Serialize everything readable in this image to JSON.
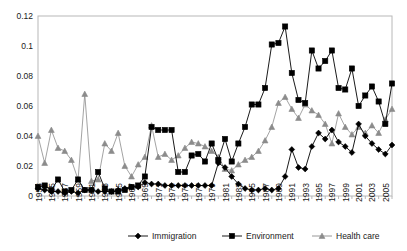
{
  "chart_data": {
    "type": "line",
    "title": "",
    "xlabel": "",
    "ylabel": "",
    "ylim": [
      0,
      0.12
    ],
    "yticks": [
      0,
      0.02,
      0.04,
      0.06,
      0.08,
      0.1,
      0.12
    ],
    "ytick_labels": [
      "0",
      "0.02",
      "0.04",
      "0.06",
      "0.08",
      "0.1",
      "0.12"
    ],
    "grid": false,
    "legend_position": "bottom",
    "x": [
      1953,
      1954,
      1955,
      1956,
      1957,
      1958,
      1959,
      1960,
      1961,
      1962,
      1963,
      1964,
      1965,
      1966,
      1967,
      1968,
      1969,
      1970,
      1971,
      1972,
      1973,
      1974,
      1975,
      1976,
      1977,
      1978,
      1979,
      1980,
      1981,
      1982,
      1983,
      1984,
      1985,
      1986,
      1987,
      1988,
      1989,
      1990,
      1991,
      1992,
      1993,
      1994,
      1995,
      1996,
      1997,
      1998,
      1999,
      2000,
      2001,
      2002,
      2003,
      2004,
      2005,
      2006
    ],
    "xtick_labels": [
      "1953",
      "1955",
      "1957",
      "1959",
      "1961",
      "1963",
      "1965",
      "1967",
      "1969",
      "1971",
      "1973",
      "1975",
      "1977",
      "1979",
      "1981",
      "1983",
      "1985",
      "1987",
      "1989",
      "1991",
      "1993",
      "1995",
      "1997",
      "1999",
      "2001",
      "2003",
      "2005"
    ],
    "series": [
      {
        "name": "Immigration",
        "marker": "diamond",
        "color": "#000000",
        "values": [
          0.005,
          0.004,
          0.003,
          0.003,
          0.002,
          0.003,
          0.002,
          0.004,
          0.004,
          0.003,
          0.003,
          0.003,
          0.004,
          0.005,
          0.006,
          0.006,
          0.009,
          0.008,
          0.008,
          0.007,
          0.007,
          0.007,
          0.007,
          0.007,
          0.007,
          0.007,
          0.007,
          0.022,
          0.019,
          0.013,
          0.008,
          0.005,
          0.004,
          0.004,
          0.005,
          0.004,
          0.005,
          0.013,
          0.031,
          0.019,
          0.018,
          0.033,
          0.042,
          0.038,
          0.044,
          0.036,
          0.033,
          0.029,
          0.048,
          0.04,
          0.035,
          0.031,
          0.028,
          0.034
        ]
      },
      {
        "name": "Environment",
        "marker": "square",
        "color": "#000000",
        "values": [
          0.006,
          0.007,
          0.004,
          0.011,
          0.003,
          0.004,
          0.011,
          0.004,
          0.004,
          0.016,
          0.005,
          0.003,
          0.003,
          0.004,
          0.006,
          0.007,
          0.013,
          0.046,
          0.044,
          0.044,
          0.044,
          0.016,
          0.016,
          0.027,
          0.028,
          0.023,
          0.035,
          0.024,
          0.038,
          0.023,
          0.035,
          0.046,
          0.061,
          0.061,
          0.072,
          0.101,
          0.102,
          0.113,
          0.082,
          0.064,
          0.062,
          0.097,
          0.085,
          0.09,
          0.097,
          0.072,
          0.071,
          0.085,
          0.06,
          0.067,
          0.073,
          0.063,
          0.048,
          0.075
        ]
      },
      {
        "name": "Health care",
        "marker": "triangle",
        "color": "#8c8c8c",
        "values": [
          0.04,
          0.022,
          0.044,
          0.032,
          0.03,
          0.024,
          0.011,
          0.068,
          0.01,
          0.011,
          0.035,
          0.03,
          0.042,
          0.02,
          0.013,
          0.021,
          0.026,
          0.047,
          0.026,
          0.028,
          0.024,
          0.027,
          0.032,
          0.036,
          0.035,
          0.033,
          0.03,
          0.026,
          0.018,
          0.017,
          0.021,
          0.024,
          0.026,
          0.03,
          0.037,
          0.046,
          0.062,
          0.066,
          0.058,
          0.052,
          0.061,
          0.057,
          0.054,
          0.048,
          0.035,
          0.055,
          0.046,
          0.041,
          0.046,
          0.042,
          0.047,
          0.042,
          0.051,
          0.058
        ]
      }
    ]
  }
}
